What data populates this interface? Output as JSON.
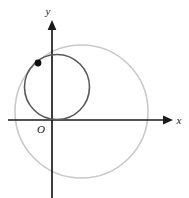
{
  "figure": {
    "background_color": "#ffffff",
    "width": 189,
    "height": 198,
    "axes": {
      "x_axis": {
        "label": "x",
        "color": "#1a1a1a",
        "y_pixel": 120,
        "x_start": 8,
        "x_end": 173
      },
      "y_axis": {
        "label": "y",
        "color": "#1a1a1a",
        "x_pixel": 52,
        "y_start": 20,
        "y_end": 198
      },
      "origin_label": "O"
    },
    "shapes": [
      {
        "name": "large-circle",
        "type": "circle",
        "cx": 81.5,
        "cy": 111.5,
        "r": 66.5,
        "stroke": "#c9c9c9",
        "stroke_width": 1.6,
        "fill": "none"
      },
      {
        "name": "small-circle",
        "type": "circle",
        "cx": 57,
        "cy": 87,
        "r": 32.5,
        "stroke": "#5a5a5a",
        "stroke_width": 1.6,
        "fill": "none"
      },
      {
        "name": "marked-point",
        "type": "point",
        "cx": 38,
        "cy": 63,
        "r": 3.4,
        "fill": "#111111"
      }
    ],
    "watermark": "· · · · ·"
  }
}
